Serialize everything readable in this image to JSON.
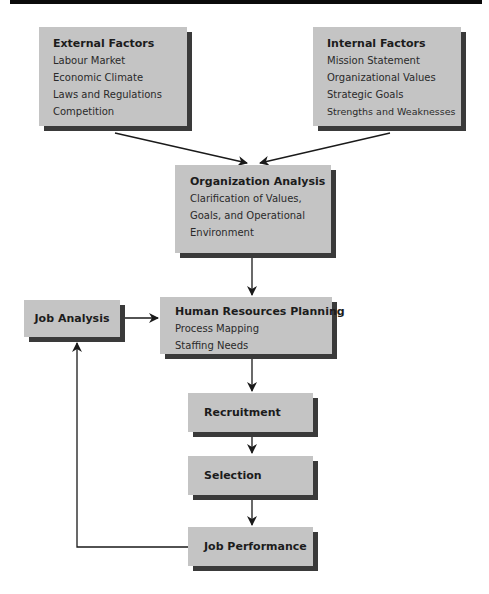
{
  "diagram": {
    "boxes": {
      "external": {
        "title": "External Factors",
        "items": [
          "Labour Market",
          "Economic Climate",
          "Laws and Regulations",
          "Competition"
        ]
      },
      "internal": {
        "title": "Internal Factors",
        "items": [
          "Mission Statement",
          "Organizational Values",
          "Strategic Goals",
          "Strengths and Weaknesses"
        ]
      },
      "org": {
        "title": "Organization Analysis",
        "items": [
          "Clarification of Values,",
          "Goals, and Operational",
          "Environment"
        ]
      },
      "job_analysis": {
        "title": "Job Analysis"
      },
      "hrp": {
        "title": "Human Resources Planning",
        "items": [
          "Process Mapping",
          "Staffing Needs"
        ]
      },
      "recruitment": {
        "title": "Recruitment"
      },
      "selection": {
        "title": "Selection"
      },
      "job_performance": {
        "title": "Job Performance"
      }
    },
    "edges": [
      {
        "from": "External Factors",
        "to": "Organization Analysis"
      },
      {
        "from": "Internal Factors",
        "to": "Organization Analysis"
      },
      {
        "from": "Organization Analysis",
        "to": "Human Resources Planning"
      },
      {
        "from": "Job Analysis",
        "to": "Human Resources Planning"
      },
      {
        "from": "Human Resources Planning",
        "to": "Recruitment"
      },
      {
        "from": "Recruitment",
        "to": "Selection"
      },
      {
        "from": "Selection",
        "to": "Job Performance"
      },
      {
        "from": "Job Performance",
        "to": "Job Analysis"
      }
    ],
    "colors": {
      "box_fill": "#c4c4c4",
      "shadow": "#3a3a3a",
      "line": "#1a1a1a"
    }
  }
}
